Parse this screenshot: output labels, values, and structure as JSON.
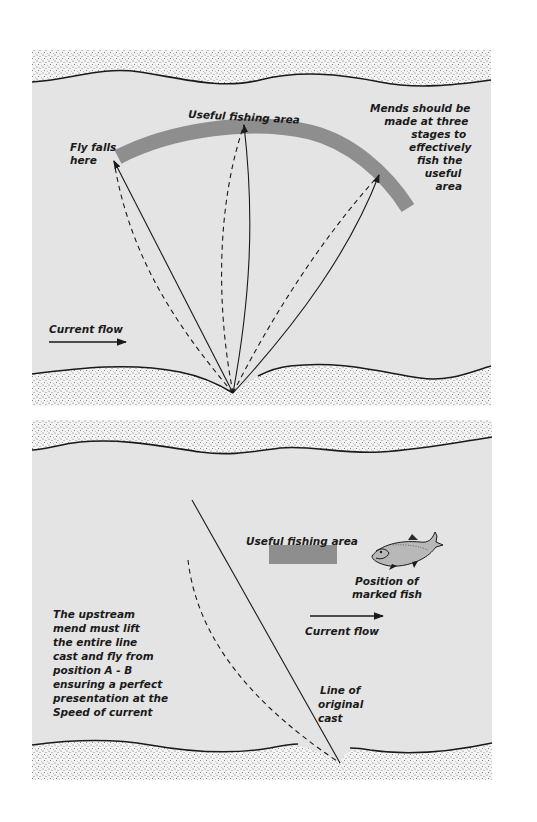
{
  "colors": {
    "water": "#e4e4e4",
    "bank_dots": "#6a6a6a",
    "bank_bg": "#f2f2f2",
    "fishing_area": "#8e8e8e",
    "line": "#1a1a1a"
  },
  "panel_top": {
    "useful_area_label": "Useful fishing area",
    "fly_falls_label": [
      "Fly falls",
      "here"
    ],
    "mends_note": [
      "Mends should be",
      "made at three",
      "stages to",
      "effectively",
      "fish the",
      "useful",
      "area"
    ],
    "current_flow_label": "Current flow"
  },
  "panel_bottom": {
    "useful_area_label": "Useful fishing area",
    "fish_label": [
      "Position of",
      "marked fish"
    ],
    "current_flow_label": "Current flow",
    "mend_note": [
      "The upstream",
      "mend must lift",
      "the entire line",
      "cast and fly from",
      "position  A - B",
      "ensuring a perfect",
      "presentation at the",
      "Speed of current"
    ],
    "original_cast_label": [
      "Line of",
      "original",
      "cast"
    ]
  }
}
